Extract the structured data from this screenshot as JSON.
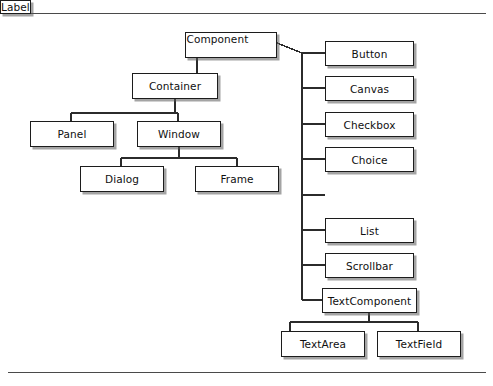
{
  "diagram": {
    "type": "class-hierarchy-tree",
    "colors": {
      "box_border": "#1c1c1c",
      "box_fill": "#ffffff",
      "edge": "#2b2b2b",
      "rule": "#4a4a4a",
      "text": "#101010"
    },
    "rules": {
      "top_label": "page-rule-top",
      "bottom_label": "page-rule-bottom"
    },
    "nodes": [
      {
        "id": "component",
        "label": "Component",
        "x": 185,
        "y": 32,
        "w": 92,
        "h": 26
      },
      {
        "id": "container",
        "label": "Container",
        "x": 132,
        "y": 73,
        "w": 86,
        "h": 26
      },
      {
        "id": "panel",
        "label": "Panel",
        "x": 30,
        "y": 121,
        "w": 84,
        "h": 26
      },
      {
        "id": "window",
        "label": "Window",
        "x": 137,
        "y": 121,
        "w": 84,
        "h": 26
      },
      {
        "id": "dialog",
        "label": "Dialog",
        "x": 80,
        "y": 166,
        "w": 84,
        "h": 26
      },
      {
        "id": "frame",
        "label": "Frame",
        "x": 195,
        "y": 166,
        "w": 84,
        "h": 26
      },
      {
        "id": "button",
        "label": "Button",
        "x": 325,
        "y": 41,
        "w": 89,
        "h": 25
      },
      {
        "id": "canvas",
        "label": "Canvas",
        "x": 325,
        "y": 76,
        "w": 89,
        "h": 25
      },
      {
        "id": "checkbox",
        "label": "Checkbox",
        "x": 325,
        "y": 112,
        "w": 89,
        "h": 25
      },
      {
        "id": "choice",
        "label": "Choice",
        "x": 325,
        "y": 147,
        "w": 89,
        "h": 25
      },
      {
        "id": "label",
        "label": "Label",
        "x": 325,
        "y": 183,
        "w": 89,
        "h": 25
      },
      {
        "id": "list",
        "label": "List",
        "x": 325,
        "y": 218,
        "w": 89,
        "h": 25
      },
      {
        "id": "scrollbar",
        "label": "Scrollbar",
        "x": 325,
        "y": 253,
        "w": 89,
        "h": 25
      },
      {
        "id": "textcomponent",
        "label": "TextComponent",
        "x": 322,
        "y": 288,
        "w": 95,
        "h": 25
      },
      {
        "id": "textarea",
        "label": "TextArea",
        "x": 281,
        "y": 331,
        "w": 84,
        "h": 26
      },
      {
        "id": "textfield",
        "label": "TextField",
        "x": 377,
        "y": 331,
        "w": 84,
        "h": 26
      }
    ],
    "edges": [
      {
        "from": "component",
        "to": "container"
      },
      {
        "from": "container",
        "to": "panel"
      },
      {
        "from": "container",
        "to": "window"
      },
      {
        "from": "window",
        "to": "dialog"
      },
      {
        "from": "window",
        "to": "frame"
      },
      {
        "from": "component",
        "to": "button"
      },
      {
        "from": "component",
        "to": "canvas"
      },
      {
        "from": "component",
        "to": "checkbox"
      },
      {
        "from": "component",
        "to": "choice"
      },
      {
        "from": "component",
        "to": "label"
      },
      {
        "from": "component",
        "to": "list"
      },
      {
        "from": "component",
        "to": "scrollbar"
      },
      {
        "from": "component",
        "to": "textcomponent"
      },
      {
        "from": "textcomponent",
        "to": "textarea"
      },
      {
        "from": "textcomponent",
        "to": "textfield"
      }
    ]
  }
}
